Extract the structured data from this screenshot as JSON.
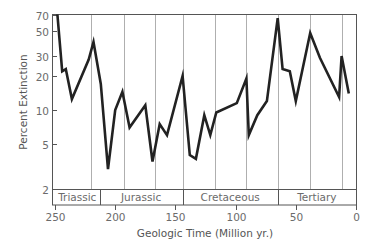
{
  "chart_data": {
    "type": "line",
    "title": "",
    "xlabel": "Geologic Time (Million yr.)",
    "ylabel": "Percent Extinction",
    "y_scale": "log",
    "xlim": [
      250,
      0
    ],
    "ylim": [
      2,
      70
    ],
    "grid": "vertical",
    "x_ticks": [
      250,
      200,
      150,
      100,
      50,
      0
    ],
    "x_tick_labels": [
      "250",
      "200",
      "150",
      "100",
      "50",
      "0"
    ],
    "y_ticks": [
      2,
      5,
      10,
      20,
      30,
      50,
      70
    ],
    "y_tick_labels": [
      "2",
      "5",
      "10",
      "20",
      "30",
      "50",
      "70"
    ],
    "periods": [
      {
        "name": "Triassic",
        "start": 250,
        "end": 213
      },
      {
        "name": "Jurassic",
        "start": 213,
        "end": 144
      },
      {
        "name": "Cretaceous",
        "start": 144,
        "end": 65
      },
      {
        "name": "Tertiary",
        "start": 65,
        "end": 0
      }
    ],
    "gridlines_x": [
      220,
      193,
      167,
      144,
      117,
      91,
      65,
      38,
      12
    ],
    "series": [
      {
        "name": "Percent Extinction",
        "x": [
          248,
          244,
          241,
          236,
          222,
          218,
          212,
          206,
          200,
          194,
          188,
          175,
          169,
          163,
          157,
          144,
          138,
          133,
          126,
          121,
          116,
          99,
          91,
          89,
          82,
          74,
          65,
          61,
          55,
          50,
          44,
          38,
          30,
          14,
          12,
          6
        ],
        "y": [
          70,
          22,
          23,
          12.5,
          28,
          40,
          17,
          3,
          10,
          14.5,
          7,
          11,
          3.5,
          7.5,
          6,
          20,
          4,
          3.7,
          9,
          6,
          9.5,
          11.5,
          19,
          6,
          9,
          12,
          65,
          23,
          22,
          12,
          24,
          48,
          29,
          13,
          30,
          14
        ]
      }
    ]
  }
}
